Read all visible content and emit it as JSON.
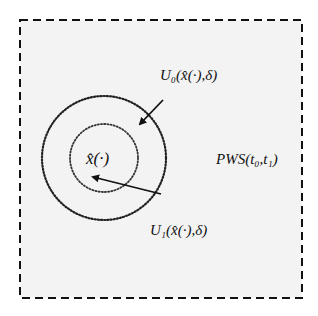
{
  "diagram": {
    "type": "set-neighborhoods",
    "background_color": "#f3f3f3",
    "border": {
      "style": "dashed",
      "color": "#111111"
    },
    "labels": {
      "center": "x̂(·)",
      "outer_region": "U₀(x̂(·),δ)",
      "inner_region": "U₁(x̂(·),δ)",
      "space": "PWS(t₀,t₁)"
    },
    "circles": [
      {
        "name": "outer",
        "cx": 104,
        "cy": 158,
        "r": 62,
        "style": "dotted"
      },
      {
        "name": "inner",
        "cx": 104,
        "cy": 158,
        "r": 34,
        "style": "dotted"
      }
    ],
    "arrows": [
      {
        "name": "outer-pointer",
        "label": "U₀(x̂(·),δ)",
        "from": [
          163,
          100
        ],
        "to": [
          140,
          124
        ]
      },
      {
        "name": "inner-pointer",
        "label": "U₁(x̂(·),δ)",
        "from": [
          161,
          194
        ],
        "to": [
          93,
          177
        ]
      }
    ]
  }
}
